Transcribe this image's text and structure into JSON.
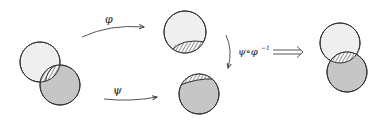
{
  "labels": {
    "phi": "φ",
    "psi": "ψ",
    "composition": "ψ∘φ",
    "inverse_exp": "−1"
  },
  "colors": {
    "light_fill": "#efefef",
    "dark_fill": "#c6c6c6",
    "stroke": "#333333",
    "hatch": "#333333",
    "arrow": "#555555"
  },
  "diagram": {
    "nodes": [
      {
        "id": "source",
        "shapes": [
          "light-disc",
          "dark-disc",
          "hatched-overlap"
        ]
      },
      {
        "id": "image-phi",
        "shapes": [
          "light-disc",
          "hatched-bottom-cap"
        ]
      },
      {
        "id": "image-psi",
        "shapes": [
          "dark-disc",
          "hatched-top-cap"
        ]
      },
      {
        "id": "result",
        "shapes": [
          "light-disc",
          "dark-disc",
          "hatched-overlap"
        ]
      }
    ],
    "arrows": [
      {
        "from": "source",
        "to": "image-phi",
        "label": "φ"
      },
      {
        "from": "source",
        "to": "image-psi",
        "label": "ψ"
      },
      {
        "from": "image-phi",
        "to": "image-psi",
        "label": "ψ∘φ⁻¹"
      },
      {
        "from": "composition",
        "to": "result",
        "label": "⟹",
        "style": "double"
      }
    ]
  }
}
